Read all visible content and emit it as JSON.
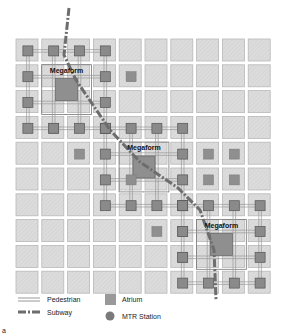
{
  "diagram": {
    "grid": {
      "cols": 10,
      "rows": 10,
      "origin_x": 16,
      "origin_y": 39,
      "pitch": 25.8,
      "block_size": 22
    },
    "megaforms": [
      {
        "label": "Megaform",
        "ring": {
          "c0": 0,
          "r0": 0,
          "c1": 3,
          "r1": 3
        },
        "atrium": {
          "c": 1.5,
          "r": 1.5
        }
      },
      {
        "label": "Megaform",
        "ring": {
          "c0": 3,
          "r0": 3,
          "c1": 6,
          "r1": 6
        },
        "atrium": {
          "c": 4.5,
          "r": 4.5
        }
      },
      {
        "label": "Megaform",
        "ring": {
          "c0": 6,
          "r0": 6,
          "c1": 9,
          "r1": 9
        },
        "atrium": {
          "c": 7.5,
          "r": 7.5
        }
      }
    ],
    "small_atria": [
      [
        4,
        1
      ],
      [
        1,
        3
      ],
      [
        3,
        3
      ],
      [
        2,
        4
      ],
      [
        7,
        4
      ],
      [
        8,
        4
      ],
      [
        4,
        5
      ],
      [
        7,
        5
      ],
      [
        8,
        5
      ],
      [
        6,
        6
      ],
      [
        5,
        7
      ],
      [
        6,
        7
      ],
      [
        6,
        8
      ]
    ],
    "subway_path": "M69,8 L64,55 L76,80 L110,130 L140,162 L178,188 L200,210 L214,250 L216,300",
    "colors": {
      "block": "#d9d9d9",
      "block_border": "#b8b8b8",
      "station": "#8a8a8a",
      "atrium": "#8f8f8f",
      "subway": "#6a6a6a",
      "pedestrian": "#9a9a9a"
    }
  },
  "legend": {
    "pedestrian": "Pedestrian",
    "subway": "Subway",
    "atrium": "Atrium",
    "mtr_station": "MTR Station"
  },
  "panel_label": "a"
}
